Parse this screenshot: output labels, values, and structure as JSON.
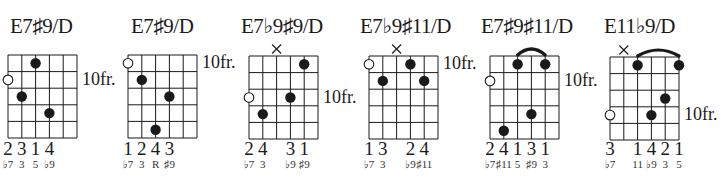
{
  "colors": {
    "ink": "#1a1a1a",
    "background": "#ffffff"
  },
  "chords": [
    {
      "name": "E7♯9/D",
      "fret_label": "10fr.",
      "fret_label_row": 2,
      "muted": [],
      "barre": null,
      "open_circle": {
        "string": 1,
        "row": 2
      },
      "dots": [
        {
          "string": 3,
          "row": 1
        },
        {
          "string": 2,
          "row": 3
        },
        {
          "string": 4,
          "row": 4
        }
      ],
      "fingers": [
        {
          "string": 1,
          "text": "2"
        },
        {
          "string": 2,
          "text": "3"
        },
        {
          "string": 3,
          "text": "1"
        },
        {
          "string": 4,
          "text": "4"
        }
      ],
      "degrees": [
        {
          "string": 1,
          "text": "♭7"
        },
        {
          "string": 2,
          "text": "3"
        },
        {
          "string": 3,
          "text": "5"
        },
        {
          "string": 4,
          "text": "♭9"
        }
      ]
    },
    {
      "name": "E7♯9/D",
      "fret_label": "10fr.",
      "fret_label_row": 1,
      "muted": [],
      "barre": null,
      "open_circle": {
        "string": 1,
        "row": 1
      },
      "dots": [
        {
          "string": 2,
          "row": 2
        },
        {
          "string": 4,
          "row": 3
        },
        {
          "string": 3,
          "row": 5
        }
      ],
      "fingers": [
        {
          "string": 1,
          "text": "1"
        },
        {
          "string": 2,
          "text": "2"
        },
        {
          "string": 3,
          "text": "4"
        },
        {
          "string": 4,
          "text": "3"
        }
      ],
      "degrees": [
        {
          "string": 1,
          "text": "♭7"
        },
        {
          "string": 2,
          "text": "3"
        },
        {
          "string": 3,
          "text": "R"
        },
        {
          "string": 4,
          "text": "♯9"
        }
      ]
    },
    {
      "name": "E7♭9♯9/D",
      "fret_label": "10fr.",
      "fret_label_row": 3,
      "muted": [
        3
      ],
      "barre": null,
      "open_circle": {
        "string": 1,
        "row": 3
      },
      "dots": [
        {
          "string": 5,
          "row": 1
        },
        {
          "string": 4,
          "row": 3
        },
        {
          "string": 2,
          "row": 4
        }
      ],
      "fingers": [
        {
          "string": 1,
          "text": "2"
        },
        {
          "string": 2,
          "text": "4"
        },
        {
          "string": 4,
          "text": "3"
        },
        {
          "string": 5,
          "text": "1"
        }
      ],
      "degrees": [
        {
          "string": 1,
          "text": "♭7"
        },
        {
          "string": 2,
          "text": "3"
        },
        {
          "string": 4,
          "text": "♭9"
        },
        {
          "string": 5,
          "text": "♯9"
        }
      ]
    },
    {
      "name": "E7♭9♯11/D",
      "fret_label": "10fr.",
      "fret_label_row": 1,
      "muted": [
        3
      ],
      "barre": null,
      "open_circle": {
        "string": 1,
        "row": 1
      },
      "dots": [
        {
          "string": 4,
          "row": 1
        },
        {
          "string": 2,
          "row": 2
        },
        {
          "string": 5,
          "row": 2
        }
      ],
      "fingers": [
        {
          "string": 1,
          "text": "1"
        },
        {
          "string": 2,
          "text": "3"
        },
        {
          "string": 4,
          "text": "2"
        },
        {
          "string": 5,
          "text": "4"
        }
      ],
      "degrees": [
        {
          "string": 1,
          "text": "♭7"
        },
        {
          "string": 2,
          "text": "3"
        },
        {
          "string": 4,
          "text": "♭9"
        },
        {
          "string": 5,
          "text": "♯11"
        }
      ]
    },
    {
      "name": "E7♯9♯11/D",
      "fret_label": "10fr.",
      "fret_label_row": 2,
      "muted": [],
      "barre": {
        "from": 3,
        "to": 5,
        "row": 1
      },
      "open_circle": {
        "string": 1,
        "row": 2
      },
      "dots": [
        {
          "string": 3,
          "row": 1
        },
        {
          "string": 5,
          "row": 1
        },
        {
          "string": 4,
          "row": 4
        },
        {
          "string": 2,
          "row": 5
        }
      ],
      "fingers": [
        {
          "string": 1,
          "text": "2"
        },
        {
          "string": 2,
          "text": "4"
        },
        {
          "string": 3,
          "text": "1"
        },
        {
          "string": 4,
          "text": "3"
        },
        {
          "string": 5,
          "text": "1"
        }
      ],
      "degrees": [
        {
          "string": 1,
          "text": "♭7"
        },
        {
          "string": 2,
          "text": "♯11"
        },
        {
          "string": 3,
          "text": "5"
        },
        {
          "string": 4,
          "text": "♯9"
        },
        {
          "string": 5,
          "text": "3"
        }
      ]
    },
    {
      "name": "E11♭9/D",
      "fret_label": "10fr.",
      "fret_label_row": 4,
      "muted": [
        2
      ],
      "barre": {
        "from": 3,
        "to": 6,
        "row": 1
      },
      "open_circle": {
        "string": 1,
        "row": 4
      },
      "dots": [
        {
          "string": 3,
          "row": 1
        },
        {
          "string": 6,
          "row": 1
        },
        {
          "string": 5,
          "row": 3
        },
        {
          "string": 4,
          "row": 4
        }
      ],
      "fingers": [
        {
          "string": 1,
          "text": "3"
        },
        {
          "string": 3,
          "text": "1"
        },
        {
          "string": 4,
          "text": "4"
        },
        {
          "string": 5,
          "text": "2"
        },
        {
          "string": 6,
          "text": "1"
        }
      ],
      "degrees": [
        {
          "string": 1,
          "text": "♭7"
        },
        {
          "string": 3,
          "text": "11"
        },
        {
          "string": 4,
          "text": "♭9"
        },
        {
          "string": 5,
          "text": "3"
        },
        {
          "string": 6,
          "text": "5"
        }
      ]
    }
  ]
}
